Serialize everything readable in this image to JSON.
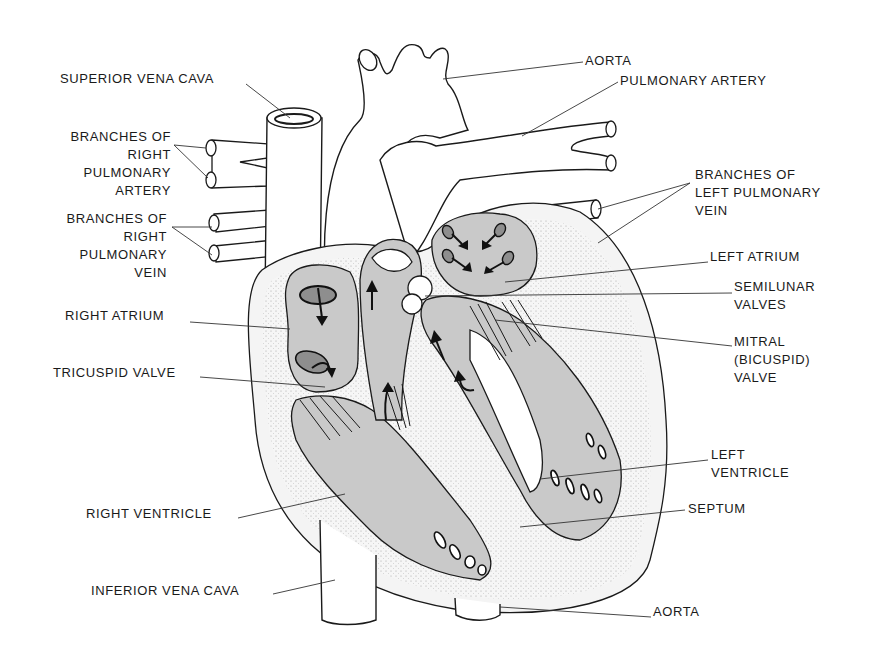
{
  "diagram": {
    "labels": [
      {
        "id": "superior-vena-cava",
        "text": "SUPERIOR VENA CAVA",
        "x": 60,
        "y": 70,
        "align": "left",
        "leader": [
          [
            246,
            84
          ],
          [
            290,
            118
          ]
        ]
      },
      {
        "id": "branches-right-pulmonary-artery",
        "text": "BRANCHES OF\nRIGHT\nPULMONARY\nARTERY",
        "x": 58,
        "y": 128,
        "align": "right",
        "w": 113,
        "leader": [
          [
            174,
            145
          ],
          [
            206,
            148
          ]
        ],
        "leader2": [
          [
            174,
            145
          ],
          [
            208,
            178
          ]
        ]
      },
      {
        "id": "branches-right-pulmonary-vein",
        "text": "BRANCHES OF\nRIGHT\nPULMONARY\nVEIN",
        "x": 54,
        "y": 210,
        "align": "right",
        "w": 113,
        "leader": [
          [
            172,
            227
          ],
          [
            212,
            227
          ]
        ],
        "leader2": [
          [
            172,
            227
          ],
          [
            212,
            255
          ]
        ]
      },
      {
        "id": "right-atrium",
        "text": "RIGHT ATRIUM",
        "x": 65,
        "y": 307,
        "align": "left",
        "leader": [
          [
            190,
            322
          ],
          [
            290,
            329
          ]
        ]
      },
      {
        "id": "tricuspid-valve",
        "text": "TRICUSPID VALVE",
        "x": 53,
        "y": 364,
        "align": "left",
        "leader": [
          [
            200,
            377
          ],
          [
            325,
            387
          ]
        ]
      },
      {
        "id": "right-ventricle",
        "text": "RIGHT VENTRICLE",
        "x": 86,
        "y": 505,
        "align": "left",
        "leader": [
          [
            238,
            518
          ],
          [
            345,
            494
          ]
        ]
      },
      {
        "id": "inferior-vena-cava",
        "text": "INFERIOR VENA CAVA",
        "x": 91,
        "y": 582,
        "align": "left",
        "leader": [
          [
            273,
            594
          ],
          [
            335,
            580
          ]
        ]
      },
      {
        "id": "aorta-top",
        "text": "AORTA",
        "x": 585,
        "y": 52,
        "align": "left",
        "leader": [
          [
            583,
            62
          ],
          [
            443,
            79
          ]
        ]
      },
      {
        "id": "pulmonary-artery",
        "text": "PULMONARY ARTERY",
        "x": 620,
        "y": 72,
        "align": "left",
        "leader": [
          [
            618,
            82
          ],
          [
            522,
            136
          ]
        ]
      },
      {
        "id": "branches-left-pulmonary-vein",
        "text": "BRANCHES OF\nLEFT PULMONARY\nVEIN",
        "x": 695,
        "y": 166,
        "align": "left",
        "leader": [
          [
            690,
            183
          ],
          [
            598,
            209
          ]
        ],
        "leader2": [
          [
            690,
            183
          ],
          [
            598,
            243
          ]
        ]
      },
      {
        "id": "left-atrium",
        "text": "LEFT ATRIUM",
        "x": 710,
        "y": 248,
        "align": "left",
        "leader": [
          [
            708,
            262
          ],
          [
            505,
            282
          ]
        ]
      },
      {
        "id": "semilunar-valves",
        "text": "SEMILUNAR\nVALVES",
        "x": 734,
        "y": 278,
        "align": "left",
        "leader": [
          [
            732,
            293
          ],
          [
            425,
            296
          ]
        ]
      },
      {
        "id": "mitral-bicuspid-valve",
        "text": "MITRAL\n(BICUSPID)\nVALVE",
        "x": 734,
        "y": 333,
        "align": "left",
        "leader": [
          [
            732,
            346
          ],
          [
            495,
            320
          ]
        ]
      },
      {
        "id": "left-ventricle",
        "text": "LEFT\nVENTRICLE",
        "x": 711,
        "y": 446,
        "align": "left",
        "leader": [
          [
            708,
            460
          ],
          [
            540,
            479
          ]
        ]
      },
      {
        "id": "septum",
        "text": "SEPTUM",
        "x": 688,
        "y": 500,
        "align": "left",
        "leader": [
          [
            685,
            510
          ],
          [
            520,
            527
          ]
        ]
      },
      {
        "id": "aorta-bottom",
        "text": "AORTA",
        "x": 653,
        "y": 603,
        "align": "left",
        "leader": [
          [
            651,
            617
          ],
          [
            500,
            607
          ]
        ]
      }
    ],
    "colors": {
      "background": "#ffffff",
      "ink": "#1a1a1a",
      "chamber_fill": "#c9c9c9",
      "wall_fill": "#f4f4f4"
    }
  }
}
